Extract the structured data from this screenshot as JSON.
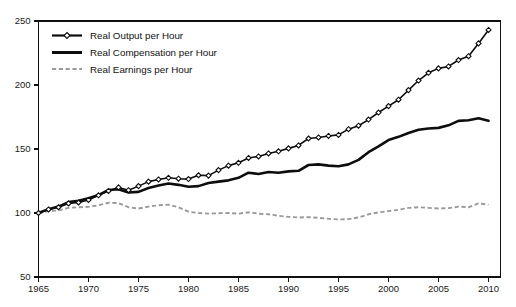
{
  "chart_data": {
    "type": "line",
    "title": "",
    "xlabel": "",
    "ylabel": "",
    "xlim": [
      1965,
      2011.2
    ],
    "ylim": [
      50,
      250
    ],
    "grid": false,
    "legend_position": "top-left",
    "xticks": [
      1965,
      1970,
      1975,
      1980,
      1985,
      1990,
      1995,
      2000,
      2005,
      2010
    ],
    "xtick_labels": [
      "1965",
      "1970",
      "1975",
      "1980",
      "1985",
      "1990",
      "1995",
      "2000",
      "2005",
      "2010"
    ],
    "yticks": [
      50,
      100,
      150,
      200,
      250
    ],
    "ytick_labels": [
      "50",
      "100",
      "150",
      "200",
      "250"
    ],
    "x": [
      1965,
      1966,
      1967,
      1968,
      1969,
      1970,
      1971,
      1972,
      1973,
      1974,
      1975,
      1976,
      1977,
      1978,
      1979,
      1980,
      1981,
      1982,
      1983,
      1984,
      1985,
      1986,
      1987,
      1988,
      1989,
      1990,
      1991,
      1992,
      1993,
      1994,
      1995,
      1996,
      1997,
      1998,
      1999,
      2000,
      2001,
      2002,
      2003,
      2004,
      2005,
      2006,
      2007,
      2008,
      2009,
      2010
    ],
    "series": [
      {
        "name": "Real Output per Hour",
        "marker": "diamond",
        "line_style": "solid",
        "color": "#0d0d0d",
        "values": [
          100,
          102.8,
          104.5,
          107.5,
          108.2,
          110.2,
          113.8,
          117.2,
          120.0,
          117.8,
          121.0,
          124.5,
          126.2,
          127.5,
          126.8,
          126.5,
          129.5,
          129.2,
          133.5,
          137.0,
          139.2,
          143.0,
          144.2,
          146.5,
          148.2,
          150.5,
          152.8,
          158.2,
          159.0,
          160.2,
          161.0,
          165.5,
          168.2,
          173.0,
          178.5,
          183.5,
          188.5,
          196.0,
          203.5,
          209.5,
          213.0,
          214.5,
          219.5,
          222.5,
          232.5,
          243.0
        ]
      },
      {
        "name": "Real Compensation per Hour",
        "marker": "none",
        "line_style": "solid",
        "color": "#0d0d0d",
        "values": [
          100,
          103.0,
          105.0,
          108.5,
          109.5,
          111.5,
          114.0,
          118.0,
          118.5,
          116.0,
          116.5,
          119.5,
          121.5,
          123.0,
          122.0,
          120.5,
          121.0,
          123.5,
          124.5,
          125.5,
          127.5,
          131.5,
          130.5,
          132.0,
          131.5,
          132.5,
          133.0,
          137.5,
          138.0,
          137.0,
          136.5,
          138.0,
          141.5,
          147.5,
          152.0,
          157.0,
          159.5,
          162.5,
          165.0,
          166.0,
          166.5,
          168.5,
          172.0,
          172.5,
          174.0,
          172.0
        ]
      },
      {
        "name": "Real Earnings per Hour",
        "marker": "none",
        "line_style": "dashed",
        "color": "#9a9a9a",
        "values": [
          100,
          101.5,
          102.0,
          104.0,
          104.5,
          104.8,
          106.0,
          108.0,
          107.8,
          104.5,
          103.5,
          105.0,
          106.0,
          106.5,
          104.5,
          101.0,
          100.0,
          99.5,
          99.8,
          100.0,
          99.5,
          100.5,
          99.5,
          99.0,
          97.8,
          97.0,
          96.5,
          96.8,
          96.2,
          95.5,
          95.0,
          95.2,
          96.5,
          99.0,
          100.5,
          101.5,
          102.5,
          104.0,
          104.5,
          104.0,
          103.5,
          103.8,
          105.0,
          104.5,
          107.5,
          106.5
        ]
      }
    ]
  },
  "legend": {
    "items": [
      {
        "label": "Real Output per Hour"
      },
      {
        "label": "Real Compensation per Hour"
      },
      {
        "label": "Real Earnings per Hour"
      }
    ]
  }
}
